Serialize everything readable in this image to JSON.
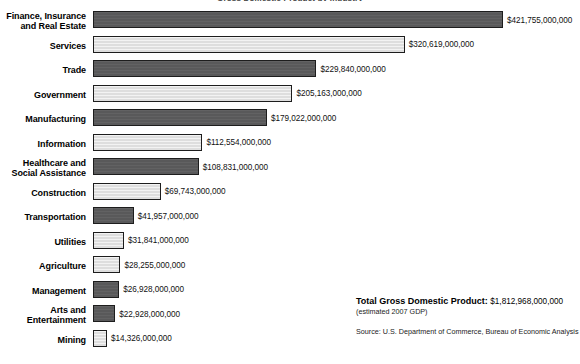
{
  "chart_data": {
    "type": "bar",
    "orientation": "horizontal",
    "title": "Gross Domestic Product by Industry",
    "xlabel": "",
    "ylabel": "",
    "grid": false,
    "legend": "none",
    "xlim": [
      0,
      421755000000
    ],
    "categories": [
      "Finance, Insurance\nand Real Estate",
      "Services",
      "Trade",
      "Government",
      "Manufacturing",
      "Information",
      "Healthcare and\nSocial Assistance",
      "Construction",
      "Transportation",
      "Utilities",
      "Agriculture",
      "Management",
      "Arts and\nEntertainment",
      "Mining"
    ],
    "values": [
      421755000000,
      320619000000,
      229840000000,
      205163000000,
      179022000000,
      112554000000,
      108831000000,
      69743000000,
      41957000000,
      31841000000,
      28255000000,
      26928000000,
      22928000000,
      14326000000
    ],
    "value_labels": [
      "$421,755,000,000",
      "$320,619,000,000",
      "$229,840,000,000",
      "$205,163,000,000",
      "$179,022,000,000",
      "$112,554,000,000",
      "$108,831,000,000",
      "$69,743,000,000",
      "$41,957,000,000",
      "$31,841,000,000",
      "$28,255,000,000",
      "$26,928,000,000",
      "$22,928,000,000",
      "$14,326,000,000"
    ],
    "bar_fills": [
      "dark",
      "light",
      "dark",
      "light",
      "dark",
      "light",
      "dark",
      "light",
      "dark",
      "light",
      "light",
      "dark",
      "dark",
      "light"
    ],
    "colors": {
      "dark": "#59595A",
      "light": "#E2E2E2",
      "border": "#1D1D1D",
      "background": "#FFFFFF",
      "text": "#000000"
    },
    "annotations": {
      "total_label": "Total Gross Domestic Product:",
      "total_value": "$1,812,968,000,000",
      "total_note": "(estimated 2007 GDP)",
      "source": "Source: U.S. Department of Commerce, Bureau of Economic Analysis"
    }
  }
}
